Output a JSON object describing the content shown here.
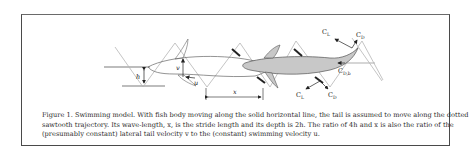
{
  "figure": {
    "caption_lines": [
      "Figure 1. Swimming model. With fish body moving along the solid horizontal line, the tail is assumed to move along the dotted",
      "sawtooth trajectory. Its wave-length, x, is the stride length and its depth is 2h. The ratio of 4h and x is also the ratio of the",
      "(presumably constant) lateral tail velocity v to the (constant) swimming velocity u."
    ],
    "labels": {
      "h": "h",
      "v": "v",
      "u": "u",
      "x": "x",
      "cl_top": "C",
      "cl_top_sub": "L",
      "cd_top": "C",
      "cd_top_sub": "D",
      "cdb": "C",
      "cdb_sub": "D,b",
      "cl_bottom": "C",
      "cl_bottom_sub": "L",
      "cd_bottom": "C",
      "cd_bottom_sub": "D"
    },
    "colors": {
      "fish_shaded": "#c8c8c8",
      "fish_outline": "#555555",
      "trajectory": "#b0b0b0",
      "ink": "#222222"
    }
  }
}
